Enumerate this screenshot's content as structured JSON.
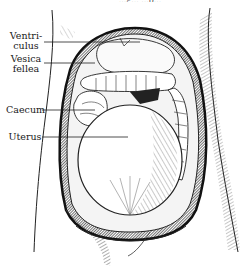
{
  "figure": {
    "caption_fragment": "...g... ...p...",
    "labels": [
      {
        "id": "ventriculus",
        "line1": "Ventri-",
        "line2": "culus"
      },
      {
        "id": "vesica-fellea",
        "line1": "Vesica",
        "line2": "fellea"
      },
      {
        "id": "caecum",
        "line1": "Caecum",
        "line2": ""
      },
      {
        "id": "uterus",
        "line1": "Uterus",
        "line2": ""
      }
    ],
    "colors": {
      "ink": "#1a1a1a",
      "paper": "#ffffff",
      "shade": "#555555"
    }
  }
}
